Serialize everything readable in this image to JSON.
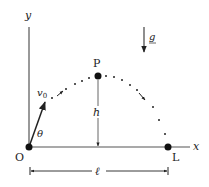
{
  "diagram": {
    "labels": {
      "y_axis": "y",
      "x_axis": "x",
      "origin": "O",
      "landing": "L",
      "apex": "P",
      "velocity": "v",
      "velocity_sub": "0",
      "angle": "θ",
      "height": "h",
      "range": "ℓ",
      "gravity": "g"
    },
    "colors": {
      "stroke": "#333333",
      "text": "#222222",
      "background": "#ffffff"
    }
  }
}
